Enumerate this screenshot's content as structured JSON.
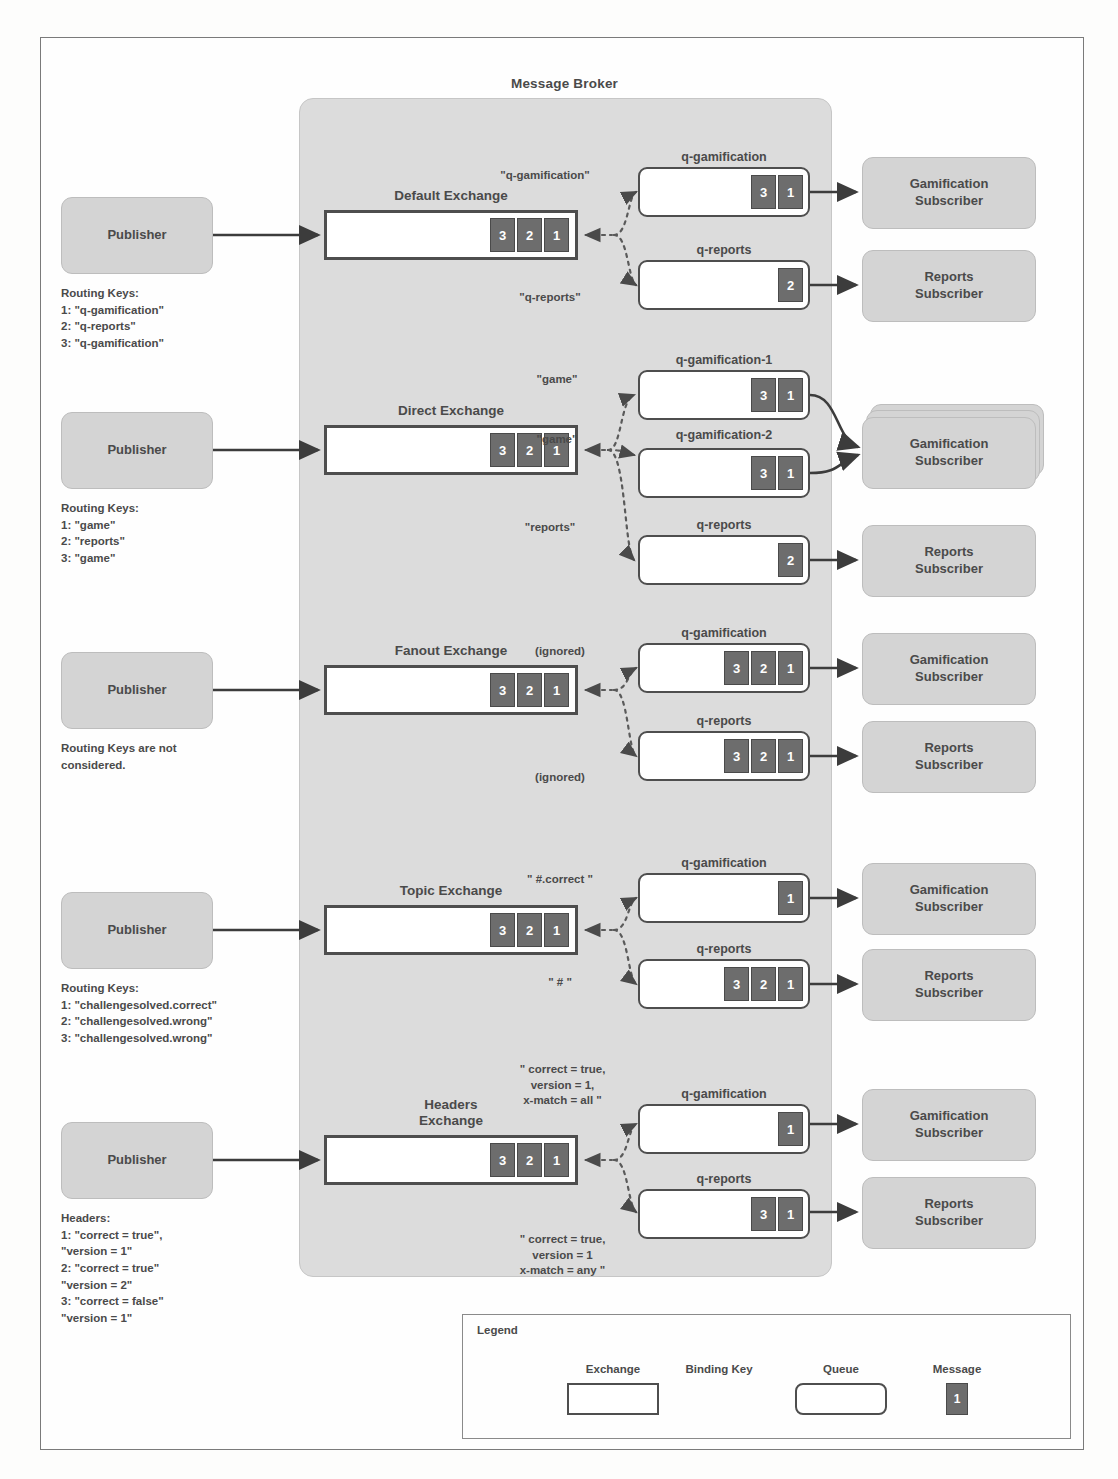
{
  "broker": {
    "title": "Message Broker"
  },
  "legend": {
    "title": "Legend",
    "exchange_label": "Exchange",
    "binding_key_label": "Binding Key",
    "queue_label": "Queue",
    "message_label": "Message",
    "message_value": "1"
  },
  "sections": [
    {
      "id": "default",
      "publisher_label": "Publisher",
      "caption": "Routing Keys:\n1: \"q-gamification\"\n2: \"q-reports\"\n3: \"q-gamification\"",
      "exchange_label": "Default Exchange",
      "exchange_messages": [
        "3",
        "2",
        "1"
      ],
      "queues": [
        {
          "name": "q-gamification",
          "binding_key": "\"q-gamification\"",
          "messages": [
            "3",
            "1"
          ],
          "subscriber": "Gamification\nSubscriber",
          "stacked": false
        },
        {
          "name": "q-reports",
          "binding_key": "\"q-reports\"",
          "messages": [
            "2"
          ],
          "subscriber": "Reports\nSubscriber",
          "stacked": false
        }
      ]
    },
    {
      "id": "direct",
      "publisher_label": "Publisher",
      "caption": "Routing Keys:\n1: \"game\"\n2: \"reports\"\n3: \"game\"",
      "exchange_label": "Direct Exchange",
      "exchange_messages": [
        "3",
        "2",
        "1"
      ],
      "queues": [
        {
          "name": "q-gamification-1",
          "binding_key": "\"game\"",
          "messages": [
            "3",
            "1"
          ],
          "subscriber": "Gamification\nSubscriber",
          "stacked": true
        },
        {
          "name": "q-gamification-2",
          "binding_key": "\"game\"",
          "messages": [
            "3",
            "1"
          ],
          "subscriber": "",
          "stacked": false
        },
        {
          "name": "q-reports",
          "binding_key": "\"reports\"",
          "messages": [
            "2"
          ],
          "subscriber": "Reports\nSubscriber",
          "stacked": false
        }
      ]
    },
    {
      "id": "fanout",
      "publisher_label": "Publisher",
      "caption": "Routing Keys are not\nconsidered.",
      "exchange_label": "Fanout Exchange",
      "exchange_messages": [
        "3",
        "2",
        "1"
      ],
      "queues": [
        {
          "name": "q-gamification",
          "binding_key": "(ignored)",
          "messages": [
            "3",
            "2",
            "1"
          ],
          "subscriber": "Gamification\nSubscriber",
          "stacked": false
        },
        {
          "name": "q-reports",
          "binding_key": "(ignored)",
          "messages": [
            "3",
            "2",
            "1"
          ],
          "subscriber": "Reports\nSubscriber",
          "stacked": false
        }
      ]
    },
    {
      "id": "topic",
      "publisher_label": "Publisher",
      "caption": "Routing Keys:\n1: \"challengesolved.correct\"\n2: \"challengesolved.wrong\"\n3: \"challengesolved.wrong\"",
      "exchange_label": "Topic Exchange",
      "exchange_messages": [
        "3",
        "2",
        "1"
      ],
      "queues": [
        {
          "name": "q-gamification",
          "binding_key": "\" #.correct \"",
          "messages": [
            "1"
          ],
          "subscriber": "Gamification\nSubscriber",
          "stacked": false
        },
        {
          "name": "q-reports",
          "binding_key": "\" # \"",
          "messages": [
            "3",
            "2",
            "1"
          ],
          "subscriber": "Reports\nSubscriber",
          "stacked": false
        }
      ]
    },
    {
      "id": "headers",
      "publisher_label": "Publisher",
      "caption": "Headers:\n1: \"correct = true\",\n\"version = 1\"\n2: \"correct = true\"\n\"version = 2\"\n3: \"correct = false\"\n\"version = 1\"",
      "exchange_label": "Headers\nExchange",
      "exchange_messages": [
        "3",
        "2",
        "1"
      ],
      "queues": [
        {
          "name": "q-gamification",
          "binding_key": "\" correct = true,\nversion = 1,\nx-match = all \"",
          "messages": [
            "1"
          ],
          "subscriber": "Gamification\nSubscriber",
          "stacked": false
        },
        {
          "name": "q-reports",
          "binding_key": "\" correct = true,\nversion = 1\nx-match = any \"",
          "messages": [
            "3",
            "1"
          ],
          "subscriber": "Reports\nSubscriber",
          "stacked": false
        }
      ]
    }
  ],
  "colors": {
    "node_fill": "#d4d4d4",
    "broker_fill": "#dcdcdc",
    "message_fill": "#6d6d6d",
    "stroke": "#4e4e4e"
  }
}
